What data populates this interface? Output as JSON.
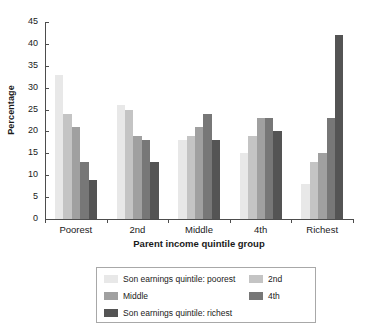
{
  "chart_data": {
    "type": "bar",
    "title": "",
    "subtitle": "",
    "xlabel": "Parent income quintile group",
    "ylabel": "Percentage",
    "categories": [
      "Poorest",
      "2nd",
      "Middle",
      "4th",
      "Richest"
    ],
    "series": [
      {
        "name": "Son earnings quintile: poorest",
        "color": "#e8e8e8",
        "values": [
          33,
          26,
          18,
          15,
          8
        ]
      },
      {
        "name": "2nd",
        "color": "#c4c4c4",
        "values": [
          24,
          25,
          19,
          19,
          13
        ]
      },
      {
        "name": "Middle",
        "color": "#a0a0a0",
        "values": [
          21,
          19,
          21,
          23,
          15
        ]
      },
      {
        "name": "4th",
        "color": "#777777",
        "values": [
          13,
          18,
          24,
          23,
          23
        ]
      },
      {
        "name": "Son earnings quintile: richest",
        "color": "#545454",
        "values": [
          9,
          13,
          18,
          20,
          42
        ]
      }
    ],
    "ylim": [
      0,
      45
    ],
    "ytick_step": 5,
    "yticks": [
      "0",
      "5",
      "10",
      "15",
      "20",
      "25",
      "30",
      "35",
      "40",
      "45"
    ],
    "grid": false,
    "legend_position": "bottom",
    "axis_color": "#4d4d4d"
  },
  "legend": {
    "items": [
      {
        "label": "Son earnings quintile: poorest",
        "color": "#e8e8e8"
      },
      {
        "label": "2nd",
        "color": "#c4c4c4"
      },
      {
        "label": "Middle",
        "color": "#a0a0a0"
      },
      {
        "label": "4th",
        "color": "#777777"
      },
      {
        "label": "Son earnings quintile: richest",
        "color": "#545454"
      }
    ]
  }
}
